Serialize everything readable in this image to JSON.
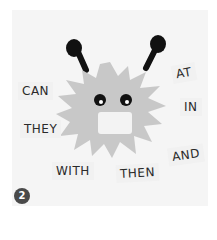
{
  "scene": {
    "description": "Paper craft monster with sight-word cards",
    "monster_color": "#c8c8c8",
    "antenna_color": "#111111",
    "background_color": "#f5f5f5"
  },
  "words": [
    {
      "text": "CAN",
      "x": 18,
      "y": 85,
      "rotate": 0
    },
    {
      "text": "THEY",
      "x": 20,
      "y": 122,
      "rotate": 0
    },
    {
      "text": "WITH",
      "x": 52,
      "y": 164,
      "rotate": 0
    },
    {
      "text": "THEN",
      "x": 116,
      "y": 166,
      "rotate": -3
    },
    {
      "text": "AND",
      "x": 168,
      "y": 148,
      "rotate": -8
    },
    {
      "text": "IN",
      "x": 180,
      "y": 100,
      "rotate": 0
    },
    {
      "text": "AT",
      "x": 172,
      "y": 66,
      "rotate": -10
    }
  ],
  "badge": {
    "number": "2"
  }
}
